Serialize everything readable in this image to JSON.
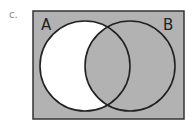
{
  "problem": {
    "label": "c."
  },
  "diagram": {
    "type": "venn",
    "sets": [
      {
        "name": "A",
        "cx": 85,
        "cy": 66,
        "r": 45
      },
      {
        "name": "B",
        "cx": 130,
        "cy": 66,
        "r": 45
      }
    ],
    "shaded_region": "complement of A only (A' ∪ B)",
    "colors": {
      "shade": "#b2b2b2",
      "unshaded": "#ffffff",
      "stroke": "#222222"
    }
  }
}
